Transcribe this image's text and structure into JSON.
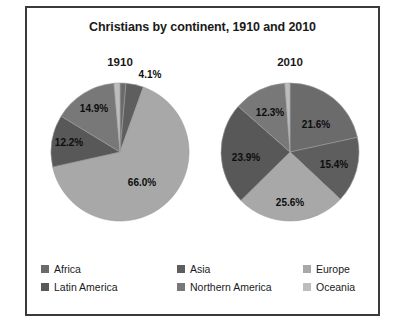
{
  "chart": {
    "title": "Christians by continent, 1910 and 2010",
    "border_color": "#3a3a3a",
    "background": "#ffffff"
  },
  "panels": [
    {
      "year": "1910"
    },
    {
      "year": "2010"
    }
  ],
  "legend": {
    "items": [
      {
        "label": "Africa",
        "color": "#6b6b6b"
      },
      {
        "label": "Asia",
        "color": "#5e5e5e"
      },
      {
        "label": "Europe",
        "color": "#a8a8a8"
      },
      {
        "label": "Latin America",
        "color": "#585858"
      },
      {
        "label": "Northern America",
        "color": "#787878"
      },
      {
        "label": "Oceania",
        "color": "#bdbdbd"
      }
    ]
  },
  "labels_1910": {
    "asia": "4.1%",
    "northern_america": "14.9%",
    "latin_america": "12.2%",
    "europe": "66.0%"
  },
  "labels_2010": {
    "africa": "21.6%",
    "asia": "15.4%",
    "europe": "25.6%",
    "latin_america": "23.9%",
    "northern_america": "12.3%"
  },
  "chart_data": {
    "type": "pie",
    "title": "Christians by continent, 1910 and 2010",
    "xlabel": "",
    "ylabel": "",
    "grid": false,
    "legend_position": "bottom",
    "units": "percent",
    "categories": [
      "Africa",
      "Asia",
      "Europe",
      "Latin America",
      "Northern America",
      "Oceania"
    ],
    "colors": [
      "#6b6b6b",
      "#5e5e5e",
      "#a8a8a8",
      "#585858",
      "#787878",
      "#bdbdbd"
    ],
    "series": [
      {
        "name": "1910",
        "values": [
          1.4,
          4.1,
          66.0,
          12.2,
          14.9,
          1.4
        ],
        "labeled_values": {
          "Africa": null,
          "Asia": "4.1%",
          "Europe": "66.0%",
          "Latin America": "12.2%",
          "Northern America": "14.9%",
          "Oceania": null
        }
      },
      {
        "name": "2010",
        "values": [
          21.6,
          15.4,
          25.6,
          23.9,
          12.3,
          1.2
        ],
        "labeled_values": {
          "Africa": "21.6%",
          "Asia": "15.4%",
          "Europe": "25.6%",
          "Latin America": "23.9%",
          "Northern America": "12.3%",
          "Oceania": null
        }
      }
    ]
  }
}
